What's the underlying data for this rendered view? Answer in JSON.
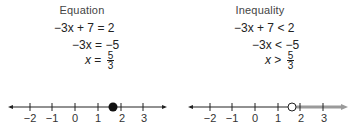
{
  "equation_panel": {
    "title": "Equation",
    "steps": [
      {
        "lhs": "−3x + 7",
        "op": "=",
        "rhs": "2"
      },
      {
        "lhs": "−3x",
        "op": "=",
        "rhs": "−5"
      },
      {
        "lhs": "x",
        "op": "=",
        "rhs_num": "5",
        "rhs_den": "3"
      }
    ],
    "number_line": {
      "ticks": [
        "−2",
        "−1",
        "0",
        "1",
        "2",
        "3"
      ],
      "point": {
        "value": "5/3",
        "style": "closed-dot"
      }
    }
  },
  "inequality_panel": {
    "title": "Inequality",
    "steps": [
      {
        "lhs": "−3x + 7",
        "op": "<",
        "rhs": "2"
      },
      {
        "lhs": "−3x",
        "op": "<",
        "rhs": "−5"
      },
      {
        "lhs": "x",
        "op": ">",
        "rhs_num": "5",
        "rhs_den": "3"
      }
    ],
    "number_line": {
      "ticks": [
        "−2",
        "−1",
        "0",
        "1",
        "2",
        "3"
      ],
      "point": {
        "value": "5/3",
        "style": "open-circle"
      },
      "shaded_direction": "right"
    }
  },
  "colors": {
    "ink": "#222222",
    "shade": "#9a9a9a"
  }
}
